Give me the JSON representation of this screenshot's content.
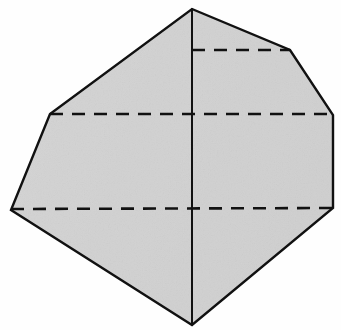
{
  "figure": {
    "name": "polyhedron-solid",
    "canvas": {
      "width": 341,
      "height": 330
    },
    "colors": {
      "background": "#fefefe",
      "face_fill": "#d2d2d2",
      "face_fill_light": "#dcdcdc",
      "edge_stroke": "#111111",
      "hidden_edge_stroke": "#111111"
    },
    "stroke_widths": {
      "outline": 2.4,
      "center_edge": 2.0,
      "hidden_edge": 2.6
    },
    "dash_pattern": "13 9",
    "vertices": {
      "apex_top": {
        "label": "apex-top",
        "x": 192,
        "y": 9
      },
      "upper_right": {
        "label": "upper-right",
        "x": 290,
        "y": 50
      },
      "right": {
        "label": "right",
        "x": 333,
        "y": 115
      },
      "right_lower": {
        "label": "right-lower",
        "x": 333,
        "y": 208
      },
      "bottom": {
        "label": "bottom",
        "x": 192,
        "y": 325
      },
      "far_left": {
        "label": "far-left",
        "x": 11,
        "y": 210
      },
      "left_upper": {
        "label": "left-upper",
        "x": 50,
        "y": 114
      }
    },
    "outline_path": "M192,9 L290,50 L333,115 L333,208 L192,325 L11,210 L50,114 Z",
    "visible_edges": [
      {
        "name": "center-vertical-edge",
        "path": "M192,9 L192,325",
        "style": "solid"
      }
    ],
    "hidden_edges": [
      {
        "name": "upper-hidden-edge",
        "path": "M192,50 L290,50",
        "style": "dashed",
        "y": 50,
        "x_start": 192,
        "x_end": 290
      },
      {
        "name": "middle-hidden-edge",
        "path": "M50,114 L333,114",
        "style": "dashed",
        "y": 114,
        "x_start": 50,
        "x_end": 333
      },
      {
        "name": "lower-hidden-edge",
        "path": "M11,209 L333,208",
        "style": "dashed",
        "y": 209,
        "x_start": 11,
        "x_end": 333
      }
    ],
    "labels": [],
    "annotations": []
  }
}
